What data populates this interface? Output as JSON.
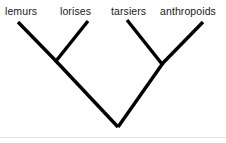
{
  "figure": {
    "type": "cladogram",
    "title": "",
    "background_color": "#ffffff",
    "branch_color": "#000000",
    "label_color": "#1a1a1a",
    "divider_color": "#e3e3e3"
  },
  "taxa": [
    {
      "label": "lemurs",
      "x": 5,
      "y": 5,
      "tip_x": 18,
      "tip_y": 22
    },
    {
      "label": "lorises",
      "x": 60,
      "y": 5,
      "tip_x": 88,
      "tip_y": 21
    },
    {
      "label": "tarsiers",
      "x": 111,
      "y": 5,
      "tip_x": 127,
      "tip_y": 20
    },
    {
      "label": "anthropoids",
      "x": 160,
      "y": 5,
      "tip_x": 203,
      "tip_y": 22
    }
  ],
  "nodes": {
    "left_clade": {
      "x": 56,
      "y": 61
    },
    "right_clade": {
      "x": 162,
      "y": 64
    },
    "root": {
      "x": 118,
      "y": 127
    }
  },
  "branches": [
    {
      "name": "lemurs-branch",
      "x1": 18,
      "y1": 22,
      "x2": 56,
      "y2": 61
    },
    {
      "name": "lorises-branch",
      "x1": 88,
      "y1": 21,
      "x2": 56,
      "y2": 61
    },
    {
      "name": "tarsiers-branch",
      "x1": 127,
      "y1": 20,
      "x2": 162,
      "y2": 64
    },
    {
      "name": "anthropoids-branch",
      "x1": 203,
      "y1": 22,
      "x2": 162,
      "y2": 64
    },
    {
      "name": "strepsirrhine-stem",
      "x1": 56,
      "y1": 61,
      "x2": 118,
      "y2": 127
    },
    {
      "name": "haplorhine-stem",
      "x1": 162,
      "y1": 64,
      "x2": 118,
      "y2": 127
    }
  ],
  "divider": {
    "y": 137
  }
}
